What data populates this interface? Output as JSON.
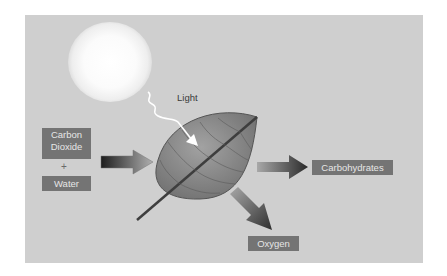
{
  "diagram": {
    "inputs": {
      "carbon_dioxide": "Carbon\nDioxide",
      "plus": "+",
      "water": "Water"
    },
    "energy": "Light",
    "outputs": {
      "carbohydrates": "Carbohydrates",
      "oxygen": "Oxygen"
    },
    "icons": [
      "sun-icon",
      "light-wave-icon",
      "leaf-icon",
      "arrow-in-icon",
      "arrow-carbohydrates-icon",
      "arrow-oxygen-icon"
    ],
    "colors": {
      "background": "#cfcfcf",
      "label_box": "#747474",
      "label_text": "#e6e6e6",
      "leaf": "#8a8a8a"
    }
  }
}
